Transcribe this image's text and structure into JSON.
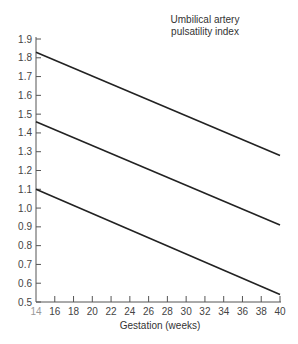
{
  "chart_data": {
    "type": "line",
    "title": "Umbilical artery pulsatility index",
    "xlabel": "Gestation (weeks)",
    "ylabel": "",
    "xlim": [
      14,
      40
    ],
    "ylim": [
      0.5,
      1.9
    ],
    "x_ticks": [
      14,
      16,
      18,
      20,
      22,
      24,
      26,
      28,
      30,
      32,
      34,
      36,
      38,
      40
    ],
    "y_ticks": [
      0.5,
      0.6,
      0.7,
      0.8,
      0.9,
      1.0,
      1.1,
      1.2,
      1.3,
      1.4,
      1.5,
      1.6,
      1.7,
      1.8,
      1.9
    ],
    "grid": false,
    "legend": null,
    "series": [
      {
        "name": "upper",
        "x": [
          14,
          40
        ],
        "values": [
          1.83,
          1.28
        ]
      },
      {
        "name": "middle",
        "x": [
          14,
          40
        ],
        "values": [
          1.46,
          0.91
        ]
      },
      {
        "name": "lower",
        "x": [
          14,
          40
        ],
        "values": [
          1.1,
          0.54
        ]
      }
    ]
  },
  "labels": {
    "title_line1": "Umbilical artery",
    "title_line2": "pulsatility index",
    "xlabel": "Gestation (weeks)"
  }
}
